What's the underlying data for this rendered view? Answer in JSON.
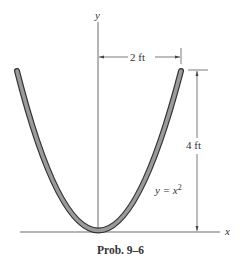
{
  "figure": {
    "caption": "Prob. 9–6",
    "axes": {
      "x_label": "x",
      "y_label": "y"
    },
    "dimensions": {
      "half_width": "2 ft",
      "height": "4 ft"
    },
    "curve": {
      "equation_lhs": "y = x",
      "equation_exp": "2",
      "type": "parabola",
      "color": "#8a8a8a",
      "outline": "#333333"
    }
  }
}
